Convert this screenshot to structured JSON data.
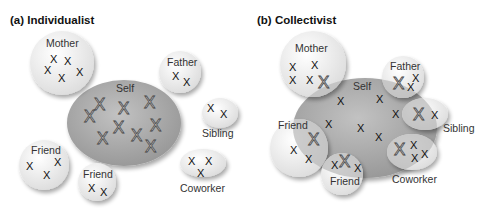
{
  "panels": [
    {
      "id": "a",
      "title": "(a)  Individualist",
      "self_label": "Self",
      "others": [
        "Mother",
        "Father",
        "Sibling",
        "Friend",
        "Friend",
        "Coworker"
      ]
    },
    {
      "id": "b",
      "title": "(b)  Collectivist",
      "self_label": "Self",
      "others": [
        "Mother",
        "Father",
        "Sibling",
        "Friend",
        "Friend",
        "Coworker"
      ]
    }
  ],
  "labels": {
    "a_mother": "Mother",
    "a_father": "Father",
    "a_sibling": "Sibling",
    "a_friend1": "Friend",
    "a_friend2": "Friend",
    "a_coworker": "Coworker",
    "a_self": "Self",
    "b_mother": "Mother",
    "b_father": "Father",
    "b_sibling": "Sibling",
    "b_friend1": "Friend",
    "b_friend2": "Friend",
    "b_coworker": "Coworker",
    "b_self": "Self",
    "x": "X"
  },
  "colors": {
    "self_fill": "#a8a8a8",
    "other_fill": "#f2f2f2",
    "overlap_fill": "#c4c4c4"
  }
}
